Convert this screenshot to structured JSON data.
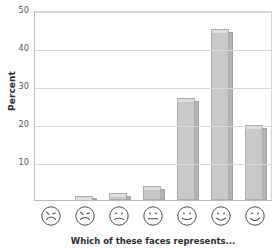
{
  "chart_data": {
    "type": "bar",
    "title": "",
    "xlabel": "Which of these faces represents...",
    "ylabel": "Percent",
    "categories": [
      "very-unhappy-face",
      "unhappy-face",
      "slightly-unhappy-face",
      "neutral-face",
      "slightly-happy-face",
      "happy-face",
      "very-happy-face"
    ],
    "category_labels": [
      "Very unhappy",
      "Unhappy",
      "Slightly unhappy",
      "Neutral",
      "Slightly happy",
      "Happy",
      "Very happy"
    ],
    "values": [
      0,
      1,
      1.8,
      3.6,
      26.8,
      45,
      19.7
    ],
    "ylim": [
      0,
      50
    ],
    "yticks": [
      10,
      20,
      30,
      40,
      50
    ],
    "ytick_labels": [
      "10",
      "20",
      "30",
      "40",
      "50"
    ],
    "grid": true,
    "legend": "none",
    "bar_color": "#c9c9c9",
    "bar_edge_color": "#adadad",
    "gridline_color": "#d9d9d9",
    "axis_color": "#b9b9b9",
    "background_color": "#ffffff"
  },
  "axis": {
    "y_title": "Percent",
    "x_title": "Which of these faces represents..."
  }
}
